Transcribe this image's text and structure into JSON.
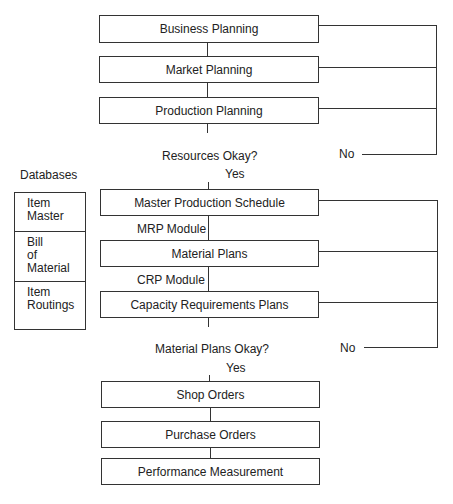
{
  "diagram": {
    "planning_boxes": [
      {
        "label": "Business Planning"
      },
      {
        "label": "Market Planning"
      },
      {
        "label": "Production Planning"
      }
    ],
    "decision_1": {
      "question": "Resources Okay?",
      "yes": "Yes",
      "no": "No"
    },
    "execution_boxes": [
      {
        "label": "Master Production Schedule"
      },
      {
        "label": "Material Plans"
      },
      {
        "label": "Capacity Requirements Plans"
      }
    ],
    "modules": {
      "mrp": "MRP Module",
      "crp": "CRP Module"
    },
    "decision_2": {
      "question": "Material Plans Okay?",
      "yes": "Yes",
      "no": "No"
    },
    "output_boxes": [
      {
        "label": "Shop Orders"
      },
      {
        "label": "Purchase Orders"
      },
      {
        "label": "Performance Measurement"
      }
    ],
    "databases": {
      "title": "Databases",
      "items": [
        {
          "line1": "Item",
          "line2": "Master",
          "line3": ""
        },
        {
          "line1": "Bill",
          "line2": "of",
          "line3": "Material"
        },
        {
          "line1": "Item",
          "line2": "Routings",
          "line3": ""
        }
      ]
    }
  }
}
